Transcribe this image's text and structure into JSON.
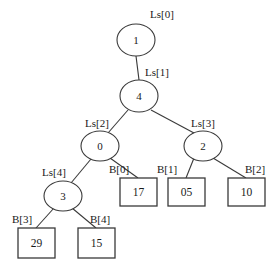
{
  "figure": {
    "type": "binary-tree-diagram",
    "background_color": "#ffffff",
    "stroke_color": "#3a3a3a",
    "text_color": "#1a1a1a"
  },
  "internal_nodes": [
    {
      "id": "n1",
      "value": "1",
      "label": "Ls[0]",
      "cx": 136,
      "cy": 40,
      "rx": 19,
      "ry": 16,
      "label_x": 162,
      "label_y": 15
    },
    {
      "id": "n4",
      "value": "4",
      "label": "Ls[1]",
      "cx": 139,
      "cy": 96,
      "rx": 19,
      "ry": 16,
      "label_x": 157,
      "label_y": 73
    },
    {
      "id": "n0",
      "value": "0",
      "label": "Ls[2]",
      "cx": 100,
      "cy": 146,
      "rx": 19,
      "ry": 15,
      "label_x": 97,
      "label_y": 124
    },
    {
      "id": "n2",
      "value": "2",
      "label": "Ls[3]",
      "cx": 203,
      "cy": 146,
      "rx": 19,
      "ry": 15,
      "label_x": 203,
      "label_y": 124
    },
    {
      "id": "n3",
      "value": "3",
      "label": "Ls[4]",
      "cx": 63,
      "cy": 196,
      "rx": 19,
      "ry": 15,
      "label_x": 54,
      "label_y": 173
    }
  ],
  "leaf_boxes": [
    {
      "id": "b0",
      "value": "17",
      "label": "B[0]",
      "x": 120,
      "y": 178,
      "w": 37,
      "h": 28,
      "label_x": 119,
      "label_y": 170
    },
    {
      "id": "b1",
      "value": "05",
      "label": "B[1]",
      "x": 168,
      "y": 178,
      "w": 37,
      "h": 28,
      "label_x": 167,
      "label_y": 170
    },
    {
      "id": "b2",
      "value": "10",
      "label": "B[2]",
      "x": 228,
      "y": 178,
      "w": 37,
      "h": 28,
      "label_x": 255,
      "label_y": 170
    },
    {
      "id": "b3",
      "value": "29",
      "label": "B[3]",
      "x": 18,
      "y": 228,
      "w": 37,
      "h": 30,
      "label_x": 22,
      "label_y": 220
    },
    {
      "id": "b4",
      "value": "15",
      "label": "B[4]",
      "x": 78,
      "y": 228,
      "w": 37,
      "h": 30,
      "label_x": 100,
      "label_y": 220
    }
  ],
  "edges": [
    {
      "id": "e-n1-n4",
      "from": "n1",
      "to": "n4",
      "x1": 136,
      "y1": 56,
      "x2": 139,
      "y2": 80
    },
    {
      "id": "e-n4-n0",
      "from": "n4",
      "to": "n0",
      "x1": 128,
      "y1": 110,
      "x2": 108,
      "y2": 133
    },
    {
      "id": "e-n4-n2",
      "from": "n4",
      "to": "n2",
      "x1": 151,
      "y1": 110,
      "x2": 194,
      "y2": 133
    },
    {
      "id": "e-n0-n3",
      "from": "n0",
      "to": "n3",
      "x1": 91,
      "y1": 159,
      "x2": 71,
      "y2": 183
    },
    {
      "id": "e-n0-b0",
      "from": "n0",
      "to": "b0",
      "x1": 110,
      "y1": 158,
      "x2": 138,
      "y2": 178
    },
    {
      "id": "e-n2-b1",
      "from": "n2",
      "to": "b1",
      "x1": 194,
      "y1": 158,
      "x2": 186,
      "y2": 178
    },
    {
      "id": "e-n2-b2",
      "from": "n2",
      "to": "b2",
      "x1": 213,
      "y1": 158,
      "x2": 246,
      "y2": 178
    },
    {
      "id": "e-n3-b3",
      "from": "n3",
      "to": "b3",
      "x1": 54,
      "y1": 208,
      "x2": 36,
      "y2": 228
    },
    {
      "id": "e-n3-b4",
      "from": "n3",
      "to": "b4",
      "x1": 72,
      "y1": 208,
      "x2": 96,
      "y2": 228
    }
  ]
}
